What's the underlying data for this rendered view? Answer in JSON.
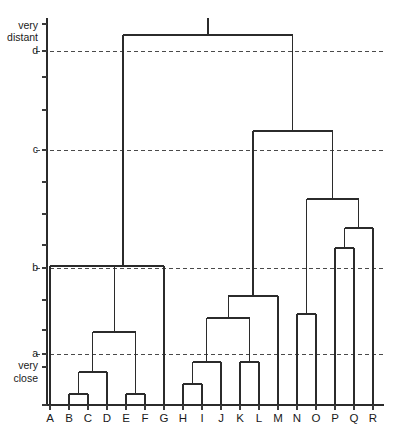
{
  "figure": {
    "title": "",
    "background_color": "#ffffff",
    "line_color": "#2b2b2b",
    "threshold_color": "#4a4a4a",
    "width_px": 394,
    "height_px": 435
  },
  "axis": {
    "top_label_line1": "very",
    "top_label_line2": "distant",
    "bottom_label_line1": "very",
    "bottom_label_line2": "close",
    "threshold_labels": [
      "d",
      "c",
      "b",
      "a"
    ],
    "x_axis_label": ""
  },
  "chart_data": {
    "type": "dendrogram",
    "title": "",
    "xlabel": "",
    "ylabel": "distance",
    "grid": false,
    "legend": "none",
    "y_direction": "top = very distant, bottom = very close",
    "ylim": [
      0,
      1
    ],
    "leaves": [
      "A",
      "B",
      "C",
      "D",
      "E",
      "F",
      "G",
      "H",
      "I",
      "J",
      "K",
      "L",
      "M",
      "N",
      "O",
      "P",
      "Q",
      "R"
    ],
    "leaf_count": 18,
    "threshold_lines": [
      {
        "label": "d",
        "y_px": 51,
        "height": 0.895
      },
      {
        "label": "c",
        "y_px": 150,
        "height": 0.639
      },
      {
        "label": "b",
        "y_px": 268,
        "height": 0.335
      },
      {
        "label": "a",
        "y_px": 354,
        "height": 0.113
      }
    ],
    "axis_ticks_y_px": [
      24,
      51,
      77,
      110,
      150,
      182,
      214,
      245,
      268,
      300,
      330,
      354,
      367,
      405
    ],
    "merges": [
      {
        "id": "m1",
        "left": "B",
        "right": "C",
        "y_px": 394,
        "height": 0.031
      },
      {
        "id": "m2",
        "left": "E",
        "right": "F",
        "y_px": 394,
        "height": 0.031
      },
      {
        "id": "m3",
        "left": "H",
        "right": "I",
        "y_px": 384,
        "height": 0.057
      },
      {
        "id": "m4",
        "left": "m1",
        "right": "D",
        "y_px": 372,
        "height": 0.088
      },
      {
        "id": "m5",
        "left": "m3",
        "right": "J",
        "y_px": 362,
        "height": 0.114
      },
      {
        "id": "m6",
        "left": "K",
        "right": "L",
        "y_px": 362,
        "height": 0.114
      },
      {
        "id": "m7",
        "left": "m4",
        "right": "m2",
        "y_px": 332,
        "height": 0.192
      },
      {
        "id": "m8",
        "left": "m5",
        "right": "m6",
        "y_px": 318,
        "height": 0.228
      },
      {
        "id": "m9",
        "left": "N",
        "right": "O",
        "y_px": 314,
        "height": 0.238
      },
      {
        "id": "m10",
        "left": "m8",
        "right": "M",
        "y_px": 296,
        "height": 0.285
      },
      {
        "id": "m11",
        "left": "A",
        "right": "m7",
        "y_px": 266,
        "height": 0.362
      },
      {
        "id": "m12",
        "left": "m11",
        "right": "G",
        "y_px": 266,
        "height": 0.362
      },
      {
        "id": "m13",
        "left": "P",
        "right": "Q",
        "y_px": 248,
        "height": 0.409
      },
      {
        "id": "m14",
        "left": "m13",
        "right": "R",
        "y_px": 228,
        "height": 0.46
      },
      {
        "id": "m15",
        "left": "m9",
        "right": "m14",
        "y_px": 199,
        "height": 0.535
      },
      {
        "id": "m16",
        "left": "m10",
        "right": "m15",
        "y_px": 131,
        "height": 0.71
      },
      {
        "id": "m17",
        "left": "m12",
        "right": "m16",
        "y_px": 35,
        "height": 0.958
      }
    ]
  },
  "leaf_labels": [
    "A",
    "B",
    "C",
    "D",
    "E",
    "F",
    "G",
    "H",
    "I",
    "J",
    "K",
    "L",
    "M",
    "N",
    "O",
    "P",
    "Q",
    "R"
  ]
}
